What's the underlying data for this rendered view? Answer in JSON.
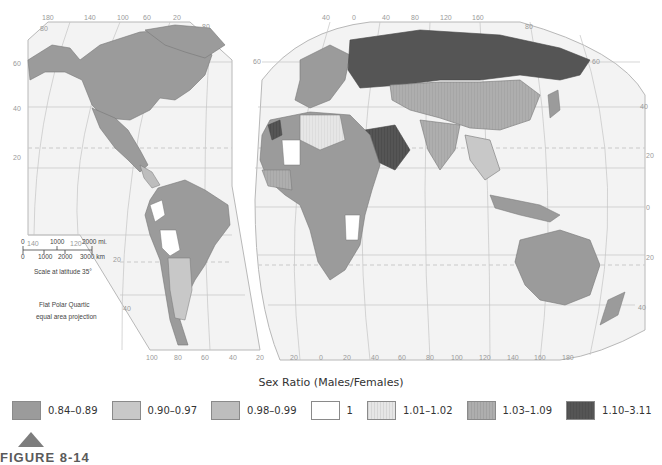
{
  "map": {
    "left_panel_top_ticks": [
      "180",
      "140",
      "100",
      "60",
      "20"
    ],
    "right_panel_top_ticks": [
      "40",
      "0",
      "40",
      "80",
      "120",
      "160"
    ],
    "left_panel_bottom_ticks": [
      "100",
      "80",
      "60",
      "40",
      "20"
    ],
    "right_panel_bottom_ticks": [
      "20",
      "0",
      "20",
      "40",
      "60",
      "80",
      "100",
      "120",
      "140",
      "160",
      "180"
    ],
    "left_side_lat_ticks": [
      "80",
      "60",
      "40",
      "20"
    ],
    "left_panel_lower_ticks": [
      "140",
      "120"
    ],
    "sa_lat_ticks": [
      "20",
      "40"
    ],
    "right_edge_lat_ticks": [
      "80",
      "60",
      "40",
      "20",
      "0",
      "20",
      "40"
    ],
    "mid_lat_ticks": [
      "80",
      "60"
    ],
    "scale_bar": {
      "miles_labels": [
        "0",
        "1000",
        "2000 mi."
      ],
      "km_labels": [
        "0",
        "1000",
        "2000",
        "3000 km"
      ],
      "caption": "Scale at latitude 35°"
    },
    "projection_note": [
      "Flat Polar Quartic",
      "equal area projection"
    ]
  },
  "legend": {
    "title": "Sex Ratio (Males/Females)",
    "items": [
      {
        "label": "0.84–0.89",
        "color": "#9b9b9b",
        "hatch": false
      },
      {
        "label": "0.90–0.97",
        "color": "#c8c8c8",
        "hatch": false
      },
      {
        "label": "0.98–0.99",
        "color": "#bdbdbd",
        "hatch": false
      },
      {
        "label": "1",
        "color": "#ffffff",
        "hatch": false
      },
      {
        "label": "1.01–1.02",
        "color": "#e6e6e6",
        "hatch": true
      },
      {
        "label": "1.03–1.09",
        "color": "#aeaeae",
        "hatch": true
      },
      {
        "label": "1.10–3.11",
        "color": "#555555",
        "hatch": true
      }
    ]
  },
  "figure": {
    "label": "FIGURE 8-14"
  }
}
